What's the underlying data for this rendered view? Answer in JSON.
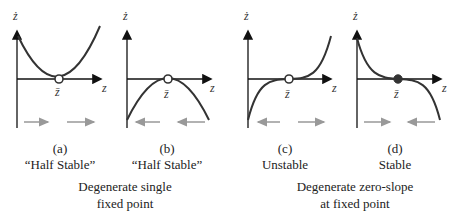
{
  "panels": [
    {
      "id": "a",
      "letter": "(a)",
      "label": "“Half Stable”",
      "curve": "parabola-up",
      "fixed_point": "open",
      "arrows": [
        "right",
        "right"
      ]
    },
    {
      "id": "b",
      "letter": "(b)",
      "label": "“Half Stable”",
      "curve": "parabola-down",
      "fixed_point": "open",
      "arrows": [
        "left",
        "left"
      ]
    },
    {
      "id": "c",
      "letter": "(c)",
      "label": "Unstable",
      "curve": "cubic-up",
      "fixed_point": "open",
      "arrows": [
        "left",
        "right"
      ]
    },
    {
      "id": "d",
      "letter": "(d)",
      "label": "Stable",
      "curve": "cubic-down",
      "fixed_point": "filled",
      "arrows": [
        "right",
        "left"
      ]
    }
  ],
  "axes": {
    "y_label": "ż",
    "x_label": "z",
    "fixed_point_label": "z̄"
  },
  "groups": [
    {
      "line1": "Degenerate single",
      "line2": "fixed point"
    },
    {
      "line1": "Degenerate zero-slope",
      "line2": "at fixed point"
    }
  ],
  "colors": {
    "curve": "#333333",
    "axis": "#111111",
    "arrow": "#999999",
    "point_fill": "#333333"
  }
}
